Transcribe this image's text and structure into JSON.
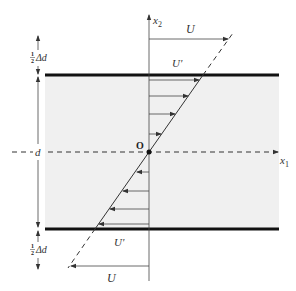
{
  "diagram": {
    "labels": {
      "x2_axis": "x",
      "x2_sub": "2",
      "x1_axis": "x",
      "x1_sub": "1",
      "origin": "O",
      "u_top": "U",
      "u_prime_top": "U'",
      "u_bottom": "U",
      "u_prime_bottom": "U'",
      "gap_top_frac_num": "1",
      "gap_top_frac_den": "2",
      "gap_top": "Δd",
      "gap_bottom_frac_num": "1",
      "gap_bottom_frac_den": "2",
      "gap_bottom": "Δd",
      "thickness": "d"
    },
    "velocity_profile": {
      "type": "linear shear (Couette)",
      "arrows_upper_count": 4,
      "arrows_lower_count": 4
    },
    "colors": {
      "fluid_fill": "#f0f0f0",
      "plate": "#111111",
      "lines": "#444444"
    }
  }
}
